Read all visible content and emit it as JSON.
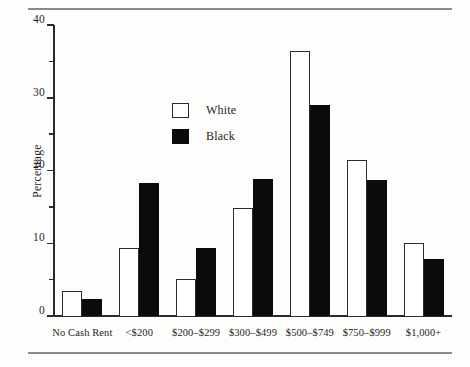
{
  "chart_data": {
    "type": "bar",
    "title": "",
    "xlabel": "",
    "ylabel": "Percentage",
    "ylim": [
      0,
      40
    ],
    "ytick_labels": [
      "0",
      "10",
      "20",
      "30",
      "40"
    ],
    "ytick_values": [
      0,
      10,
      20,
      30,
      40
    ],
    "yminor_values": [
      5,
      15,
      25,
      35
    ],
    "grid": false,
    "legend_position": "upper-left-inside",
    "categories": [
      "No Cash Rent",
      "<$200",
      "$200–$299",
      "$300–$499",
      "$500–$749",
      "$750–$999",
      "$1,000+"
    ],
    "series": [
      {
        "name": "White",
        "color": "#ffffff",
        "edge_color": "#2b2b2b",
        "values": [
          3.5,
          9.4,
          5.1,
          14.9,
          36.4,
          21.4,
          10.1
        ]
      },
      {
        "name": "Black",
        "color": "#0b0b0b",
        "edge_color": "#0b0b0b",
        "values": [
          2.3,
          18.3,
          9.3,
          18.9,
          29.0,
          18.7,
          7.9
        ]
      }
    ]
  },
  "legend": {
    "entries": [
      {
        "label": "White"
      },
      {
        "label": "Black"
      }
    ]
  }
}
